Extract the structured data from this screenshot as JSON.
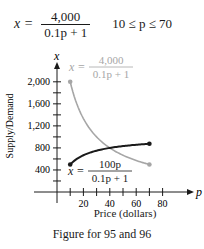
{
  "equation": {
    "lhs": "x =",
    "numerator": "4,000",
    "denominator": "0.1p + 1",
    "domain": "10 ≤ p ≤ 70"
  },
  "caption": "Figure for 95 and 96",
  "colors": {
    "demand": "#a6a6a6",
    "supply": "#1a1a1a",
    "axis": "#1a1a1a"
  },
  "chart_data": {
    "type": "line",
    "title": "",
    "xlabel": "Price (dollars)",
    "ylabel": "Supply/Demand",
    "x_axis_var": "p",
    "y_axis_var": "x",
    "xlim": [
      0,
      90
    ],
    "ylim": [
      0,
      2200
    ],
    "x_ticks": [
      20,
      40,
      60,
      80
    ],
    "x_minor_ticks": [
      10,
      20,
      30,
      40,
      50,
      60,
      70,
      80
    ],
    "y_ticks": [
      400,
      800,
      1200,
      1600,
      2000
    ],
    "y_tick_labels": [
      "400",
      "800",
      "1,200",
      "1,600",
      "2,000"
    ],
    "y_minor_ticks": [
      200,
      400,
      600,
      800,
      1000,
      1200,
      1400,
      1600,
      1800,
      2000
    ],
    "grid": false,
    "series": [
      {
        "name": "Demand",
        "label": "x = 4,000 / (0.1p + 1)",
        "label_numerator": "4,000",
        "label_denominator": "0.1p + 1",
        "color": "#a6a6a6",
        "x": [
          10,
          20,
          30,
          40,
          50,
          60,
          70
        ],
        "values": [
          2000,
          1333,
          1000,
          800,
          667,
          571,
          500
        ]
      },
      {
        "name": "Supply",
        "label": "x = 100p / (0.1p + 1)",
        "label_numerator": "100p",
        "label_denominator": "0.1p + 1",
        "color": "#1a1a1a",
        "x": [
          10,
          20,
          30,
          40,
          50,
          60,
          70
        ],
        "values": [
          500,
          667,
          750,
          800,
          833,
          857,
          875
        ]
      }
    ],
    "annotations": [
      {
        "text": "x = 4,000 / (0.1p + 1)",
        "near": "demand curve start (upper)"
      },
      {
        "text": "x = 100p / (0.1p + 1)",
        "near": "supply curve start (lower)"
      }
    ]
  }
}
